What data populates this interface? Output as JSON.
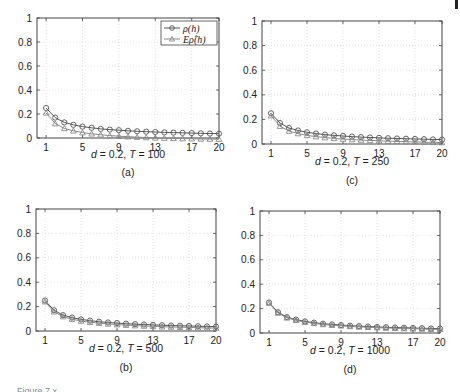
{
  "figure": {
    "caption_visible_fragment": "Figure 7.x"
  },
  "legend": {
    "series1": "ρ(h)",
    "series2": "Eρ̂(h)"
  },
  "colors": {
    "series1": "#555555",
    "series2": "#8a8a8a",
    "grid": "#d6d6d6",
    "axis": "#444444"
  },
  "chart_data": [
    {
      "id": "a",
      "type": "line",
      "panel_label": "(a)",
      "title": "",
      "xlabel": "d = 0.2, T = 100",
      "ylabel": "",
      "xlim": [
        0,
        20
      ],
      "ylim": [
        0,
        1
      ],
      "xticks": [
        1,
        5,
        9,
        13,
        17,
        20
      ],
      "yticks": [
        0,
        0.2,
        0.4,
        0.6,
        0.8,
        1
      ],
      "grid": true,
      "legend_position": "upper right",
      "x": [
        1,
        2,
        3,
        4,
        5,
        6,
        7,
        8,
        9,
        10,
        11,
        12,
        13,
        14,
        15,
        16,
        17,
        18,
        19,
        20
      ],
      "series": [
        {
          "name": "ρ(h)",
          "marker": "circle",
          "values": [
            0.25,
            0.17,
            0.13,
            0.11,
            0.095,
            0.085,
            0.076,
            0.07,
            0.065,
            0.06,
            0.056,
            0.053,
            0.05,
            0.047,
            0.045,
            0.043,
            0.041,
            0.039,
            0.037,
            0.036
          ]
        },
        {
          "name": "Eρ̂(h)",
          "marker": "triangle",
          "values": [
            0.21,
            0.12,
            0.08,
            0.06,
            0.045,
            0.035,
            0.027,
            0.02,
            0.015,
            0.011,
            0.007,
            0.004,
            0.001,
            -0.001,
            -0.003,
            -0.005,
            -0.006,
            -0.008,
            -0.009,
            -0.01
          ]
        }
      ]
    },
    {
      "id": "c",
      "type": "line",
      "panel_label": "(c)",
      "title": "",
      "xlabel": "d = 0.2, T = 250",
      "ylabel": "",
      "xlim": [
        0,
        20
      ],
      "ylim": [
        0,
        1
      ],
      "xticks": [
        1,
        5,
        9,
        13,
        17,
        20
      ],
      "yticks": [
        0,
        0.2,
        0.4,
        0.6,
        0.8,
        1
      ],
      "grid": true,
      "x": [
        1,
        2,
        3,
        4,
        5,
        6,
        7,
        8,
        9,
        10,
        11,
        12,
        13,
        14,
        15,
        16,
        17,
        18,
        19,
        20
      ],
      "series": [
        {
          "name": "ρ(h)",
          "marker": "circle",
          "values": [
            0.25,
            0.17,
            0.13,
            0.11,
            0.095,
            0.085,
            0.076,
            0.07,
            0.065,
            0.06,
            0.056,
            0.053,
            0.05,
            0.047,
            0.045,
            0.043,
            0.041,
            0.039,
            0.037,
            0.036
          ]
        },
        {
          "name": "Eρ̂(h)",
          "marker": "triangle",
          "values": [
            0.23,
            0.145,
            0.105,
            0.085,
            0.07,
            0.06,
            0.052,
            0.046,
            0.04,
            0.036,
            0.032,
            0.029,
            0.026,
            0.023,
            0.021,
            0.019,
            0.017,
            0.015,
            0.013,
            0.012
          ]
        }
      ]
    },
    {
      "id": "b",
      "type": "line",
      "panel_label": "(b)",
      "title": "",
      "xlabel": "d = 0.2, T = 500",
      "ylabel": "",
      "xlim": [
        0,
        20
      ],
      "ylim": [
        0,
        1
      ],
      "xticks": [
        1,
        5,
        9,
        13,
        17,
        20
      ],
      "yticks": [
        0,
        0.2,
        0.4,
        0.6,
        0.8,
        1
      ],
      "grid": true,
      "x": [
        1,
        2,
        3,
        4,
        5,
        6,
        7,
        8,
        9,
        10,
        11,
        12,
        13,
        14,
        15,
        16,
        17,
        18,
        19,
        20
      ],
      "series": [
        {
          "name": "ρ(h)",
          "marker": "circle",
          "values": [
            0.25,
            0.17,
            0.13,
            0.11,
            0.095,
            0.085,
            0.076,
            0.07,
            0.065,
            0.06,
            0.056,
            0.053,
            0.05,
            0.047,
            0.045,
            0.043,
            0.041,
            0.039,
            0.037,
            0.036
          ]
        },
        {
          "name": "Eρ̂(h)",
          "marker": "triangle",
          "values": [
            0.24,
            0.158,
            0.118,
            0.097,
            0.082,
            0.072,
            0.064,
            0.058,
            0.052,
            0.048,
            0.044,
            0.041,
            0.038,
            0.035,
            0.033,
            0.031,
            0.029,
            0.027,
            0.025,
            0.024
          ]
        }
      ]
    },
    {
      "id": "d",
      "type": "line",
      "panel_label": "(d)",
      "title": "",
      "xlabel": "d = 0.2, T = 1000",
      "ylabel": "",
      "xlim": [
        0,
        20
      ],
      "ylim": [
        0,
        1
      ],
      "xticks": [
        1,
        5,
        9,
        13,
        17,
        20
      ],
      "yticks": [
        0,
        0.2,
        0.4,
        0.6,
        0.8,
        1
      ],
      "grid": true,
      "x": [
        1,
        2,
        3,
        4,
        5,
        6,
        7,
        8,
        9,
        10,
        11,
        12,
        13,
        14,
        15,
        16,
        17,
        18,
        19,
        20
      ],
      "series": [
        {
          "name": "ρ(h)",
          "marker": "circle",
          "values": [
            0.25,
            0.17,
            0.13,
            0.11,
            0.095,
            0.085,
            0.076,
            0.07,
            0.065,
            0.06,
            0.056,
            0.053,
            0.05,
            0.047,
            0.045,
            0.043,
            0.041,
            0.039,
            0.037,
            0.036
          ]
        },
        {
          "name": "Eρ̂(h)",
          "marker": "triangle",
          "values": [
            0.245,
            0.164,
            0.124,
            0.104,
            0.089,
            0.079,
            0.07,
            0.064,
            0.059,
            0.054,
            0.05,
            0.047,
            0.044,
            0.041,
            0.039,
            0.037,
            0.035,
            0.033,
            0.031,
            0.03
          ]
        }
      ]
    }
  ],
  "layout": {
    "panels": {
      "a": {
        "left": 37,
        "top": 18,
        "right": 219,
        "bottom": 138,
        "xlabel_y": 158,
        "sublabel_y": 176
      },
      "c": {
        "left": 262,
        "top": 21,
        "right": 442,
        "bottom": 144,
        "xlabel_y": 165,
        "sublabel_y": 184
      },
      "b": {
        "left": 36,
        "top": 209,
        "right": 216,
        "bottom": 331,
        "xlabel_y": 352,
        "sublabel_y": 371
      },
      "d": {
        "left": 260,
        "top": 211,
        "right": 440,
        "bottom": 333,
        "xlabel_y": 354,
        "sublabel_y": 373
      }
    }
  }
}
